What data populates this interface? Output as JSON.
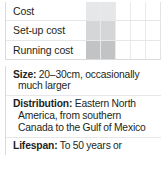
{
  "cost_panel": {
    "scale_levels": 5,
    "rows": [
      {
        "label": "Cost",
        "rating": 2,
        "level": 1
      },
      {
        "label": "Set-up cost",
        "rating": 2,
        "level": 2
      },
      {
        "label": "Running cost",
        "rating": 2,
        "level": 3
      }
    ]
  },
  "facts": [
    {
      "term": "Size:",
      "value": " 20–30cm, occasionally much larger"
    },
    {
      "term": "Distribution:",
      "value": " Eastern North America, from southern Canada to the Gulf of Mexico"
    },
    {
      "term": "Lifespan:",
      "value": " To 50 years or"
    }
  ],
  "colors": {
    "text": "#231f20",
    "rule": "#e6e7e8",
    "border": "#d9dadb",
    "fill_light": "#e6e7e8",
    "fill_mid": "#d5d6d7",
    "fill_dark": "#c2c3c4"
  }
}
